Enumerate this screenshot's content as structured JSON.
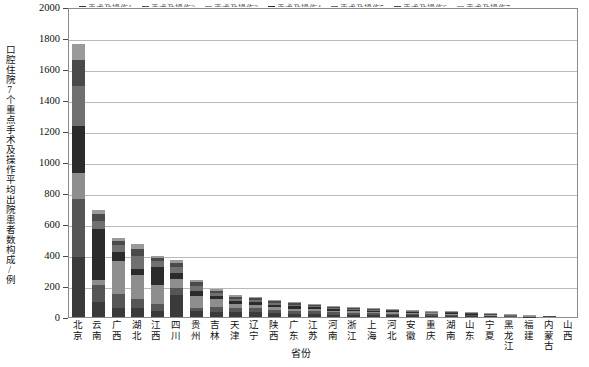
{
  "chart_data": {
    "type": "bar",
    "stacked": true,
    "title": "",
    "xlabel": "省份",
    "ylabel": "口腔住院7个重点手术及操作平均出院患者数构成/例",
    "ylim": [
      0,
      2000
    ],
    "yticks": [
      0,
      200,
      400,
      600,
      800,
      1000,
      1200,
      1400,
      1600,
      1800,
      2000
    ],
    "grid": true,
    "legend_position": "top",
    "categories": [
      "北京",
      "云南",
      "广西",
      "湖北",
      "江西",
      "四川",
      "贵州",
      "吉林",
      "天津",
      "辽宁",
      "陕西",
      "广东",
      "江苏",
      "河南",
      "浙江",
      "上海",
      "河北",
      "安徽",
      "重庆",
      "湖南",
      "山东",
      "宁夏",
      "黑龙江",
      "福建",
      "内蒙古",
      "山西"
    ],
    "series": [
      {
        "name": "手术及操作1",
        "color": "#3a3a3a",
        "values": [
          390,
          100,
          60,
          55,
          40,
          140,
          40,
          35,
          35,
          30,
          25,
          20,
          20,
          16,
          14,
          12,
          11,
          10,
          9,
          8,
          6,
          5,
          4,
          3,
          1,
          1
        ]
      },
      {
        "name": "手术及操作2",
        "color": "#565656",
        "values": [
          370,
          105,
          90,
          60,
          45,
          45,
          20,
          30,
          25,
          25,
          20,
          18,
          16,
          14,
          12,
          11,
          10,
          9,
          8,
          7,
          6,
          5,
          4,
          3,
          1,
          1
        ]
      },
      {
        "name": "手术及操作3",
        "color": "#8e8e8e",
        "values": [
          170,
          35,
          210,
          155,
          120,
          60,
          75,
          50,
          22,
          22,
          18,
          16,
          14,
          12,
          11,
          10,
          9,
          8,
          7,
          6,
          5,
          4,
          3,
          2,
          1,
          1
        ]
      },
      {
        "name": "手术及操作4",
        "color": "#2b2b2b",
        "values": [
          300,
          330,
          60,
          40,
          115,
          40,
          30,
          20,
          20,
          18,
          16,
          14,
          12,
          10,
          9,
          8,
          7,
          6,
          6,
          5,
          4,
          3,
          3,
          2,
          1,
          0
        ]
      },
      {
        "name": "手术及操作5",
        "color": "#707070",
        "values": [
          260,
          50,
          45,
          85,
          40,
          35,
          35,
          18,
          16,
          14,
          12,
          11,
          10,
          9,
          8,
          7,
          6,
          6,
          5,
          4,
          4,
          3,
          2,
          2,
          1,
          0
        ]
      },
      {
        "name": "手术及操作6",
        "color": "#4a4a4a",
        "values": [
          170,
          45,
          25,
          45,
          20,
          30,
          25,
          15,
          14,
          12,
          10,
          9,
          8,
          7,
          6,
          6,
          5,
          5,
          4,
          4,
          3,
          2,
          2,
          1,
          1,
          0
        ]
      },
      {
        "name": "手术及操作7",
        "color": "#9a9a9a",
        "values": [
          100,
          25,
          20,
          30,
          15,
          20,
          15,
          12,
          10,
          9,
          8,
          7,
          6,
          6,
          5,
          5,
          4,
          4,
          3,
          3,
          3,
          2,
          2,
          1,
          0,
          0
        ]
      }
    ],
    "totals": [
      1760,
      690,
      510,
      470,
      395,
      370,
      240,
      180,
      142,
      130,
      109,
      95,
      86,
      74,
      65,
      59,
      52,
      48,
      42,
      37,
      31,
      24,
      20,
      14,
      6,
      3
    ],
    "legend_items": [
      {
        "label": "手术及操作1",
        "color": "#3a3a3a"
      },
      {
        "label": "手术及操作2",
        "color": "#565656"
      },
      {
        "label": "手术及操作3",
        "color": "#8e8e8e"
      },
      {
        "label": "手术及操作4",
        "color": "#2b2b2b"
      },
      {
        "label": "手术及操作5",
        "color": "#707070"
      },
      {
        "label": "手术及操作6",
        "color": "#4a4a4a"
      },
      {
        "label": "手术及操作7",
        "color": "#9a9a9a"
      }
    ]
  }
}
